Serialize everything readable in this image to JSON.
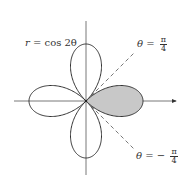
{
  "diagram": {
    "equation_label": {
      "lhs": "r",
      "rhs": "= cos 2θ"
    },
    "line_upper": {
      "lhs": "θ",
      "eq": "=",
      "sign": "",
      "num": "π",
      "den": "4"
    },
    "line_lower": {
      "lhs": "θ",
      "eq": "=",
      "sign": "−",
      "num": "π",
      "den": "4"
    },
    "shaded_region": "right petal between θ = −π/4 and θ = π/4",
    "colors": {
      "stroke": "#333333",
      "shade": "#c8c8c8",
      "dash": "#555555"
    }
  }
}
